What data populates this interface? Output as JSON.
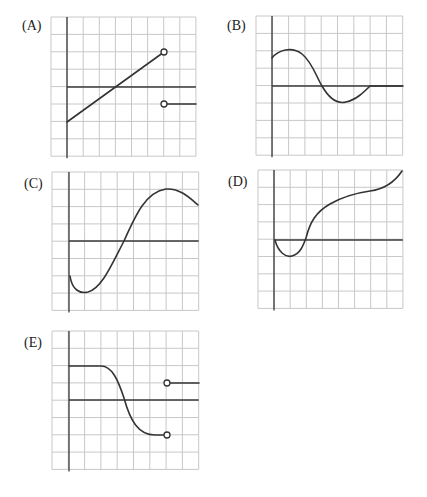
{
  "colors": {
    "grid": "#c8c8c8",
    "axis": "#3a3a3a",
    "curve": "#333333",
    "background": "#ffffff"
  },
  "panels": [
    {
      "id": "A",
      "label": "(A)",
      "label_pos": [
        22,
        30
      ],
      "grid": {
        "x0": 51,
        "y0": 17,
        "cols": 9,
        "rows": 8,
        "cw": 16.1,
        "rh": 17.4
      },
      "axes": {
        "vx": 67,
        "hy": 87
      },
      "paths": [
        "M67,122 L164,52",
        "M167,104 L196,104"
      ],
      "holes": [
        [
          164,
          52
        ],
        [
          164,
          104
        ]
      ],
      "description": "Line increasing from y=-2 at x=0 to open circle at (6,2); open circle at (6,-1) then constant segment"
    },
    {
      "id": "B",
      "label": "(B)",
      "label_pos": [
        227,
        30
      ],
      "grid": {
        "x0": 256,
        "y0": 16,
        "cols": 9,
        "rows": 8,
        "cw": 16.3,
        "rh": 17.4
      },
      "axes": {
        "vx": 272,
        "hy": 86
      },
      "paths": [
        "M272,58 C278,50 292,46 302,54 C312,62 316,76 322,86 C330,100 338,104 346,102 C356,100 364,92 370,86 L403,86"
      ],
      "holes": [],
      "description": "Starts above axis, peaks near x=1, crosses at x=3, minimum near x=4.5, returns to axis at x=6 then zero"
    },
    {
      "id": "C",
      "label": "(C)",
      "label_pos": [
        24,
        188
      ],
      "grid": {
        "x0": 52,
        "y0": 172,
        "cols": 9,
        "rows": 8,
        "cw": 16.3,
        "rh": 17.3
      },
      "axes": {
        "vx": 69,
        "hy": 241
      },
      "paths": [
        "M70,276 C72,290 80,294 88,292 C102,288 112,264 124,241 C136,214 146,192 166,189 C180,188 190,198 198,205"
      ],
      "holes": [],
      "description": "Starts below axis, minimum near x=1, crosses near x=3.3, maximum near x=6, decreasing after"
    },
    {
      "id": "D",
      "label": "(D)",
      "label_pos": [
        228,
        186
      ],
      "grid": {
        "x0": 258,
        "y0": 170,
        "cols": 9,
        "rows": 8,
        "cw": 16.1,
        "rh": 17.3
      },
      "axes": {
        "vx": 274,
        "hy": 240
      },
      "paths": [
        "M275,240 C278,252 286,258 292,256 C300,254 303,246 306,238 C310,222 316,212 330,204 C344,196 356,193 370,191 C386,189 396,180 402,171"
      ],
      "holes": [],
      "description": "Starts at origin, dips to minimum near x=1, crosses at x=2, increases with an inflection, keeps increasing"
    },
    {
      "id": "E",
      "label": "(E)",
      "label_pos": [
        24,
        347
      ],
      "grid": {
        "x0": 52,
        "y0": 331,
        "cols": 9,
        "rows": 8,
        "cw": 16.3,
        "rh": 17.3
      },
      "axes": {
        "vx": 69,
        "hy": 400
      },
      "paths": [
        "M69,366 L101,366 C112,366 118,380 124,398 C130,420 138,435 155,435 L164,435",
        "M170,383 L199,383"
      ],
      "holes": [
        [
          167,
          435
        ],
        [
          167,
          383
        ]
      ],
      "description": "Constant at y=2 until x=2, decreases smoothly crossing axis, ends at open circle (6,-2); open circle at (6,1) then constant"
    }
  ]
}
